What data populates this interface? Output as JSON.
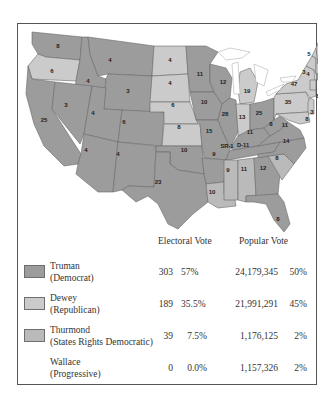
{
  "colors": {
    "truman": "#9c9c9c",
    "dewey": "#cbcbcb",
    "thurmond": "#bababa",
    "border": "#6a6a6a"
  },
  "map": {
    "states": [
      {
        "abbr": "WA",
        "ev": "8",
        "party": "truman"
      },
      {
        "abbr": "OR",
        "ev": "6",
        "party": "dewey"
      },
      {
        "abbr": "CA",
        "ev": "25",
        "party": "truman"
      },
      {
        "abbr": "ID",
        "ev": "4",
        "party": "truman"
      },
      {
        "abbr": "NV",
        "ev": "3",
        "party": "truman"
      },
      {
        "abbr": "MT",
        "ev": "4",
        "party": "truman"
      },
      {
        "abbr": "WY",
        "ev": "3",
        "party": "truman"
      },
      {
        "abbr": "UT",
        "ev": "4",
        "party": "truman"
      },
      {
        "abbr": "CO",
        "ev": "6",
        "party": "truman"
      },
      {
        "abbr": "AZ",
        "ev": "4",
        "party": "truman"
      },
      {
        "abbr": "NM",
        "ev": "4",
        "party": "truman"
      },
      {
        "abbr": "ND",
        "ev": "4",
        "party": "dewey"
      },
      {
        "abbr": "SD",
        "ev": "4",
        "party": "dewey"
      },
      {
        "abbr": "NE",
        "ev": "6",
        "party": "dewey"
      },
      {
        "abbr": "KS",
        "ev": "8",
        "party": "dewey"
      },
      {
        "abbr": "OK",
        "ev": "10",
        "party": "truman"
      },
      {
        "abbr": "TX",
        "ev": "23",
        "party": "truman"
      },
      {
        "abbr": "MN",
        "ev": "11",
        "party": "truman"
      },
      {
        "abbr": "IA",
        "ev": "10",
        "party": "truman"
      },
      {
        "abbr": "MO",
        "ev": "15",
        "party": "truman"
      },
      {
        "abbr": "AR",
        "ev": "9",
        "party": "truman"
      },
      {
        "abbr": "LA",
        "ev": "10",
        "party": "thurmond"
      },
      {
        "abbr": "WI",
        "ev": "12",
        "party": "truman"
      },
      {
        "abbr": "IL",
        "ev": "28",
        "party": "truman"
      },
      {
        "abbr": "MI",
        "ev": "19",
        "party": "dewey"
      },
      {
        "abbr": "IN",
        "ev": "13",
        "party": "dewey"
      },
      {
        "abbr": "OH",
        "ev": "25",
        "party": "truman"
      },
      {
        "abbr": "KY",
        "ev": "11",
        "party": "truman"
      },
      {
        "abbr": "TN",
        "ev": "SR-1 D-11",
        "party": "truman"
      },
      {
        "abbr": "MS",
        "ev": "9",
        "party": "thurmond"
      },
      {
        "abbr": "AL",
        "ev": "11",
        "party": "thurmond"
      },
      {
        "abbr": "GA",
        "ev": "12",
        "party": "truman"
      },
      {
        "abbr": "FL",
        "ev": "8",
        "party": "truman"
      },
      {
        "abbr": "SC",
        "ev": "8",
        "party": "thurmond"
      },
      {
        "abbr": "NC",
        "ev": "14",
        "party": "truman"
      },
      {
        "abbr": "VA",
        "ev": "11",
        "party": "truman"
      },
      {
        "abbr": "WV",
        "ev": "8",
        "party": "truman"
      },
      {
        "abbr": "PA",
        "ev": "35",
        "party": "dewey"
      },
      {
        "abbr": "NY",
        "ev": "47",
        "party": "dewey"
      },
      {
        "abbr": "VT",
        "ev": "3",
        "party": "dewey"
      },
      {
        "abbr": "NH",
        "ev": "4",
        "party": "dewey"
      },
      {
        "abbr": "ME",
        "ev": "5",
        "party": "dewey"
      },
      {
        "abbr": "MA",
        "ev": "16",
        "party": "truman"
      },
      {
        "abbr": "RI",
        "ev": "4",
        "party": "truman"
      },
      {
        "abbr": "CT",
        "ev": "8",
        "party": "dewey"
      },
      {
        "abbr": "NJ",
        "ev": "16",
        "party": "dewey"
      },
      {
        "abbr": "DE",
        "ev": "3",
        "party": "dewey"
      },
      {
        "abbr": "MD",
        "ev": "8",
        "party": "dewey"
      }
    ]
  },
  "table": {
    "headers": {
      "electoral": "Electoral Vote",
      "popular": "Popular Vote"
    },
    "rows": [
      {
        "candidate": "Truman",
        "party": "(Democrat)",
        "ev": "303",
        "ev_pct": "57%",
        "pv": "24,179,345",
        "pv_pct": "50%",
        "swatch": "truman"
      },
      {
        "candidate": "Dewey",
        "party": "(Republican)",
        "ev": "189",
        "ev_pct": "35.5%",
        "pv": "21,991,291",
        "pv_pct": "45%",
        "swatch": "dewey"
      },
      {
        "candidate": "Thurmond",
        "party": "(States Rights Democratic)",
        "ev": "39",
        "ev_pct": "7.5%",
        "pv": "1,176,125",
        "pv_pct": "2%",
        "swatch": "thurmond"
      },
      {
        "candidate": "Wallace",
        "party": "(Progressive)",
        "ev": "0",
        "ev_pct": "0.0%",
        "pv": "1,157,326",
        "pv_pct": "2%",
        "swatch": null
      }
    ]
  }
}
